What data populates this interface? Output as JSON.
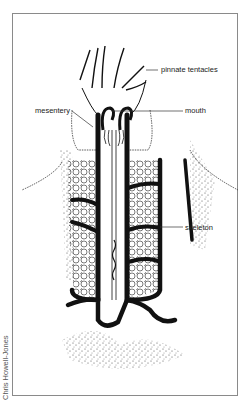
{
  "figure": {
    "labels": {
      "tentacles": "pinnate tentacles",
      "mouth": "mouth",
      "mesentery": "mesentery",
      "skeleton": "skeleton"
    },
    "credit": "Chris Howell-Jones"
  }
}
